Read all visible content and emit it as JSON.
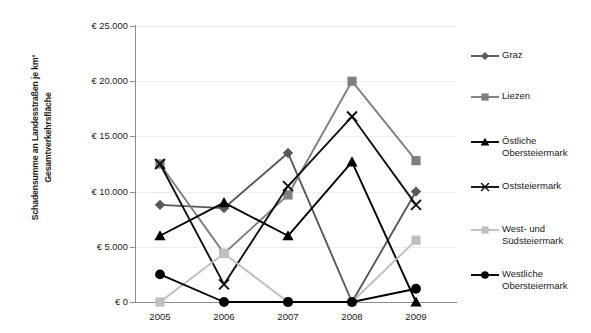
{
  "chart_data": {
    "type": "line",
    "title": "",
    "xlabel": "",
    "ylabel": "Schadensumme an Landesstraßen je km² Gesamtverkehrsfläche",
    "ylabel_lines": [
      "Schadensumme an Landesstraßen je km²",
      "Gesamtverkehrsfläche"
    ],
    "categories": [
      "2005",
      "2006",
      "2007",
      "2008",
      "2009"
    ],
    "ylim": [
      0,
      25000
    ],
    "ytick_values": [
      0,
      5000,
      10000,
      15000,
      20000,
      25000
    ],
    "ytick_labels": [
      "€ 0",
      "€ 5.000",
      "€ 10.000",
      "€ 15.000",
      "€ 20.000",
      "€ 25.000"
    ],
    "grid": true,
    "legend_position": "right",
    "series": [
      {
        "name": "Graz",
        "marker": "diamond",
        "color": "#595959",
        "values": [
          8800,
          8500,
          13500,
          0,
          10000
        ]
      },
      {
        "name": "Liezen",
        "marker": "square",
        "color": "#7f7f7f",
        "values": [
          12500,
          4400,
          9700,
          20000,
          12800
        ]
      },
      {
        "name": "Östliche Obersteiermark",
        "marker": "triangle",
        "color": "#000000",
        "values": [
          6000,
          9000,
          6000,
          12700,
          0
        ]
      },
      {
        "name": "Oststeiermark",
        "marker": "x",
        "color": "#111111",
        "values": [
          12500,
          1600,
          10500,
          16800,
          8800
        ]
      },
      {
        "name": "West- und Südsteiermark",
        "marker": "square",
        "color": "#bfbfbf",
        "values": [
          0,
          4400,
          0,
          0,
          5600
        ]
      },
      {
        "name": "Westliche Obersteiermark",
        "marker": "circle",
        "color": "#000000",
        "values": [
          2500,
          0,
          0,
          0,
          1200
        ]
      }
    ]
  },
  "legend": {
    "items": [
      {
        "label": "Graz"
      },
      {
        "label": "Liezen"
      },
      {
        "label": "Östliche\nObersteiermark"
      },
      {
        "label": "Oststeiermark"
      },
      {
        "label": "West- und\nSüdsteiermark"
      },
      {
        "label": "Westliche\nObersteiermark"
      }
    ]
  },
  "colors": {
    "axis": "#8c8c8c",
    "grid": "#eeeeee",
    "background": "#ffffff",
    "text": "#1a1a1a"
  }
}
